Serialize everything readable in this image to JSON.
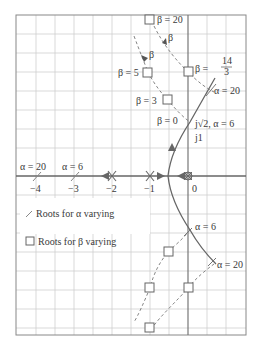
{
  "figure": {
    "type": "root-locus",
    "frame": {
      "left": 16,
      "top": 15,
      "right": 246,
      "bottom": 335
    },
    "origin_px": [
      188,
      176
    ],
    "px_per_unit": 38,
    "grid_step_px": 19,
    "colors": {
      "grid": "#c8c8c8",
      "frame": "#7a7a7a",
      "axis": "#7a7a7a",
      "locus_alpha": "#6a6a6a",
      "locus_beta": "#6a6a6a",
      "text": "#3a3a3a"
    }
  },
  "axis": {
    "ticks": [
      {
        "label": "−4",
        "value": -4
      },
      {
        "label": "−3",
        "value": -3
      },
      {
        "label": "−2",
        "value": -2
      },
      {
        "label": "−1",
        "value": -1
      },
      {
        "label": "0",
        "value": 0
      }
    ]
  },
  "annotations": {
    "beta_20": "β = 20",
    "beta_arrow_1": "β",
    "beta_arrow_2": "β",
    "beta_5": "β = 5",
    "beta_3": "β = 3",
    "beta_0": "β = 0",
    "beta_14_3_prefix": "β =",
    "beta_14_3_num": "14",
    "beta_14_3_den": "3",
    "alpha_20_upper": "α = 20",
    "alpha_6_point": "j√2, α = 6",
    "j1": "j1",
    "alpha_20_axis": "α = 20",
    "alpha_6_axis": "α = 6",
    "alpha_6_lower": "α = 6",
    "alpha_20_lower": "α = 20"
  },
  "legend": {
    "alpha_item": "Roots for α varying",
    "beta_item": "Roots for β varying"
  }
}
